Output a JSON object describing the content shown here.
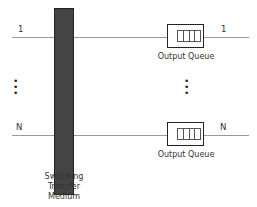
{
  "diagram": {
    "ports": [
      {
        "input_label": "1",
        "output_label": "1",
        "queue_label": "Output Queue"
      },
      {
        "input_label": "N",
        "output_label": "N",
        "queue_label": "Output Queue"
      }
    ],
    "ellipsis": "•\n•\n•",
    "fabric_label_lines": [
      "Switching",
      "Transfer",
      "Medium"
    ],
    "colors": {
      "fabric": "#444444",
      "line": "#9a9a9a",
      "queue_border": "#222222"
    }
  }
}
